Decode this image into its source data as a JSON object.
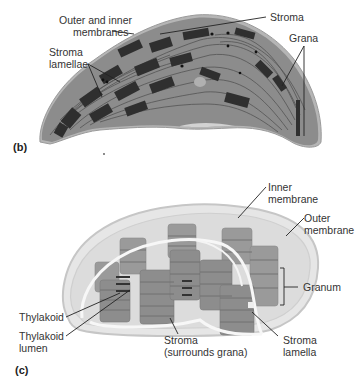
{
  "panel_b": {
    "tag": "(b)",
    "description": "Electron micrograph of a chloroplast",
    "labels": {
      "outer_inner_membranes": [
        "Outer and inner",
        "membranes"
      ],
      "stroma": "Stroma",
      "stroma_lamellae": [
        "Stroma",
        "lamellae"
      ],
      "grana": "Grana"
    }
  },
  "panel_c": {
    "tag": "(c)",
    "description": "3D cutaway drawing of a chloroplast",
    "labels": {
      "inner_membrane": [
        "Inner",
        "membrane"
      ],
      "outer_membrane": [
        "Outer",
        "membrane"
      ],
      "granum": "Granum",
      "thylakoid": "Thylakoid",
      "thylakoid_lumen": [
        "Thylakoid",
        "lumen"
      ],
      "stroma": [
        "Stroma",
        "(surrounds grana)"
      ],
      "stroma_lamella": [
        "Stroma",
        "lamella"
      ]
    }
  },
  "colors": {
    "micrograph_bg": "#8a8a8a",
    "micrograph_dark": "#2e2e2e",
    "micrograph_edge": "#b8b8b8",
    "envelope_fill": "#e4e4e4",
    "envelope_stroke": "#c8c8c8",
    "grana_fill": "#8c8c8c",
    "grana_band": "#6f6f6f",
    "leader_line": "#222222"
  }
}
